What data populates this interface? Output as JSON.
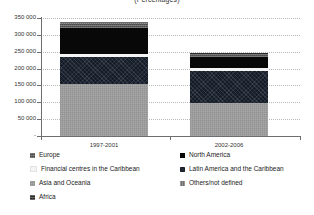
{
  "chart_data": {
    "type": "bar",
    "stacked": true,
    "title": "(Percentages)",
    "xlabel": "",
    "ylabel": "",
    "categories": [
      "1997-2001",
      "2002-2006"
    ],
    "ylim": [
      0,
      350000
    ],
    "ytick_values": [
      0,
      50000,
      100000,
      150000,
      200000,
      250000,
      300000,
      350000
    ],
    "ytick_labels": [
      "-",
      "50 000",
      "100 000",
      "150 000",
      "200 000",
      "250 000",
      "300 000",
      "350 000"
    ],
    "grid": true,
    "legend_position": "bottom",
    "series": [
      {
        "name": "Asia and Oceania",
        "key": "asia",
        "color": "#9d9d9d",
        "values": [
          153000,
          97000
        ]
      },
      {
        "name": "Latin America and the Caribbean",
        "key": "latam",
        "color": "#141c28",
        "values": [
          80000,
          97000
        ]
      },
      {
        "name": "Financial centres in the Caribbean",
        "key": "fincar",
        "color": "#f4f4f4",
        "values": [
          9000,
          9000
        ]
      },
      {
        "name": "North America",
        "key": "namerica",
        "color": "#080808",
        "values": [
          79000,
          32000
        ]
      },
      {
        "name": "Europe",
        "key": "europe",
        "color": "#5b5b5b",
        "values": [
          11000,
          9000
        ]
      },
      {
        "name": "Others/not defined",
        "key": "others",
        "color": "#6f6f6f",
        "values": [
          3000,
          2000
        ]
      },
      {
        "name": "Africa",
        "key": "africa",
        "color": "#2a2a2a",
        "values": [
          3000,
          1000
        ]
      }
    ],
    "bar_totals": [
      338000,
      247000
    ]
  },
  "legend": {
    "items": [
      {
        "label": "Europe",
        "key": "europe",
        "col": 0,
        "row": 0
      },
      {
        "label": "North America",
        "key": "namerica",
        "col": 1,
        "row": 0
      },
      {
        "label": "Financial centres in the Caribbean",
        "key": "fincar",
        "col": 0,
        "row": 1
      },
      {
        "label": "Latin America and the Caribbean",
        "key": "latam",
        "col": 1,
        "row": 1
      },
      {
        "label": "Asia and Oceania",
        "key": "asia",
        "col": 0,
        "row": 2
      },
      {
        "label": "Others/not defined",
        "key": "others",
        "col": 1,
        "row": 2
      },
      {
        "label": "Africa",
        "key": "africa",
        "col": 0,
        "row": 3
      }
    ]
  }
}
